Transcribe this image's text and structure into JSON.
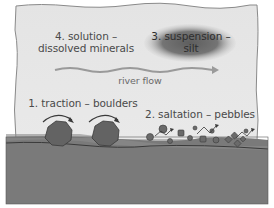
{
  "diagram": {
    "labels": {
      "solution_line1": "4. solution –",
      "solution_line2": "dissolved minerals",
      "suspension_line1": "3. suspension –",
      "suspension_line2": "silt",
      "river_flow": "river flow",
      "traction": "1. traction – boulders",
      "saltation": "2. saltation – pebbles"
    },
    "elements": {
      "water": "sky/water region (light grey)",
      "suspension_cloud": "dark grey ellipse containing silt",
      "flow_arrow": "wavy arrow pointing right",
      "boulders": 2,
      "riverbed": "dark grey riverbed with sediment layer"
    },
    "colors": {
      "water": "#e6e6e6",
      "border": "#8a8a8a",
      "cloud_center": "#6e6e6e",
      "cloud_edge": "#c8c8c8",
      "flow_arrow": "#9a9a9a",
      "bed_top": "#8c8c8c",
      "bed": "#7a7a7a",
      "bed_line": "#3a3a3a",
      "boulder": "#636363",
      "pebble": "#6a6a6a",
      "text": "#4a4a4a"
    }
  }
}
